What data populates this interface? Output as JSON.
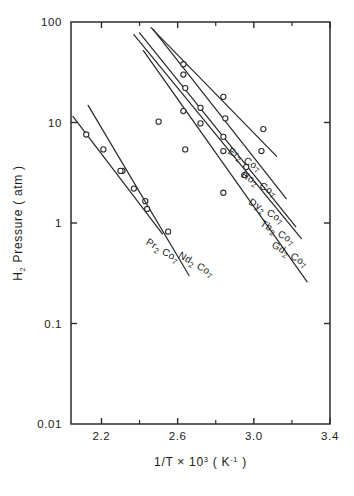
{
  "chart_data": {
    "type": "line",
    "title": "",
    "xlabel": "1/T × 10³ ( K⁻¹ )",
    "ylabel": "H₂ Pressure ( atm )",
    "xlabel_parts": {
      "pre": "1/T × 10",
      "exp": "3",
      "post": " ( K",
      "exp2": "-1",
      "post2": " )"
    },
    "ylabel_parts": {
      "pre": "H",
      "sub": "2",
      "post": " Pressure ( atm )"
    },
    "xlim": [
      2.04,
      3.4
    ],
    "ylim": [
      0.01,
      100
    ],
    "yscale": "log",
    "grid": false,
    "legend_position": "inline-right",
    "xticks": [
      2.2,
      2.6,
      3.0,
      3.4
    ],
    "xticklabels": [
      "2.2",
      "2.6",
      "3.0",
      "3.4"
    ],
    "xticks_minor": [
      2.4,
      2.8,
      3.2
    ],
    "yticks": [
      100,
      10,
      1,
      0.1,
      0.01
    ],
    "yticklabels": [
      "100",
      "10",
      "1",
      "0.1",
      "0.01"
    ],
    "series": [
      {
        "name": "Pr₂Co₇",
        "label_parts": {
          "el": "Pr",
          "sub1": "2",
          "mid": " Co",
          "sub2": "7"
        },
        "label_x": 2.43,
        "label_y": 0.62,
        "line": [
          [
            2.05,
            11.5
          ],
          [
            2.52,
            0.78
          ]
        ],
        "points": [
          [
            2.12,
            7.6
          ],
          [
            2.21,
            5.4
          ],
          [
            2.31,
            3.3
          ],
          [
            2.43,
            1.65
          ]
        ]
      },
      {
        "name": "Nd₂Co₇",
        "label_parts": {
          "el": "Nd",
          "sub1": "2",
          "mid": " Co",
          "sub2": "7"
        },
        "label_x": 2.6,
        "label_y": 0.46,
        "line": [
          [
            2.13,
            14.8
          ],
          [
            2.66,
            0.3
          ]
        ],
        "points": [
          [
            2.3,
            3.3
          ],
          [
            2.37,
            2.2
          ],
          [
            2.44,
            1.38
          ],
          [
            2.55,
            0.82
          ]
        ]
      },
      {
        "name": "Gd₂Co₇",
        "label_parts": {
          "el": "Gd",
          "sub1": "2",
          "mid": " Co",
          "sub2": "7"
        },
        "label_x": 3.09,
        "label_y": 0.58,
        "line": [
          [
            2.42,
            52.0
          ],
          [
            3.28,
            0.26
          ]
        ],
        "points": [
          [
            2.5,
            10.2
          ],
          [
            2.64,
            5.4
          ],
          [
            2.84,
            2.0
          ]
        ]
      },
      {
        "name": "Tb₂Co₇",
        "label_parts": {
          "el": "Tb",
          "sub1": "2",
          "mid": " Co",
          "sub2": "7"
        },
        "label_x": 3.03,
        "label_y": 0.95,
        "line": [
          [
            2.37,
            75.0
          ],
          [
            3.25,
            0.7
          ]
        ],
        "points": [
          [
            2.63,
            13.0
          ],
          [
            2.72,
            9.8
          ],
          [
            2.84,
            5.2
          ],
          [
            2.95,
            3.0
          ]
        ]
      },
      {
        "name": "Dy₂Co₇",
        "label_parts": {
          "el": "Dy",
          "sub1": "2",
          "mid": " Co",
          "sub2": "7"
        },
        "label_x": 2.97,
        "label_y": 1.55,
        "line": [
          [
            2.4,
            78.0
          ],
          [
            3.22,
            0.92
          ]
        ],
        "points": [
          [
            2.64,
            22.0
          ],
          [
            2.72,
            14.0
          ],
          [
            2.84,
            7.2
          ],
          [
            2.96,
            3.6
          ]
        ]
      },
      {
        "name": "Ho₂Co₇",
        "label_parts": {
          "el": "Ho",
          "sub1": "2",
          "mid": " Co",
          "sub2": "7"
        },
        "label_x": 2.93,
        "label_y": 2.9,
        "line": [
          [
            2.47,
            85.0
          ],
          [
            3.17,
            1.75
          ]
        ],
        "points": [
          [
            2.63,
            30.0
          ],
          [
            2.85,
            11.0
          ],
          [
            3.04,
            5.2
          ]
        ]
      },
      {
        "name": "Er₂Co₇",
        "label_parts": {
          "el": "Er",
          "sub1": "2",
          "mid": " Co",
          "sub2": "7"
        },
        "label_x": 2.86,
        "label_y": 5.0,
        "line": [
          [
            2.46,
            88.0
          ],
          [
            3.12,
            4.6
          ]
        ],
        "points": [
          [
            2.63,
            38.0
          ],
          [
            2.84,
            18.0
          ],
          [
            3.05,
            8.6
          ]
        ]
      }
    ]
  },
  "style": {
    "ink": "#2b2b2b",
    "background": "#ffffff"
  }
}
